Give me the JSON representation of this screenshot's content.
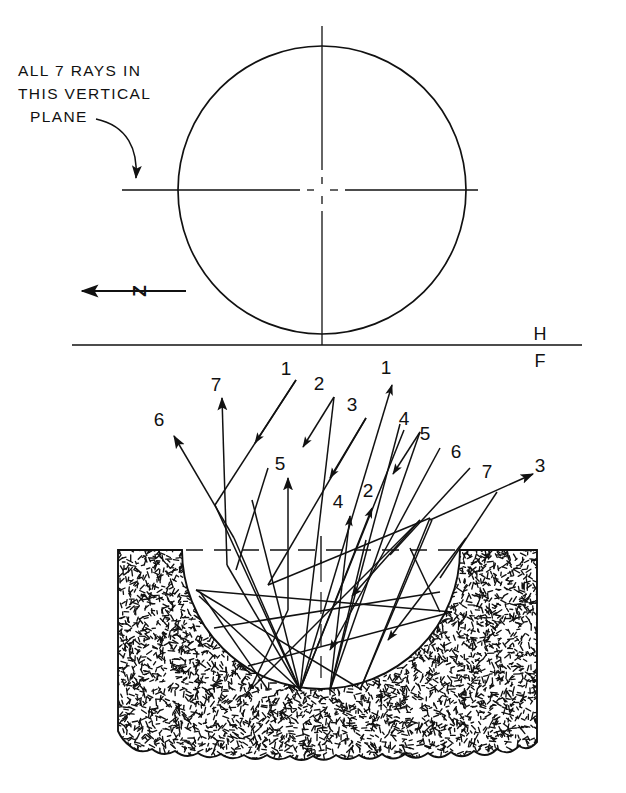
{
  "figure": {
    "type": "orthographic-ray-diagram",
    "note_lines": [
      "ALL 7 RAYS IN",
      "THIS VERTICAL",
      "PLANE"
    ],
    "axis_label": "Z",
    "fold_line": {
      "upper_label": "H",
      "lower_label": "F"
    },
    "ray_count": 7,
    "colors": {
      "ink": "#111111",
      "paper": "#ffffff"
    }
  },
  "top_view": {
    "name": "circle-top-view",
    "center": {
      "x": 322,
      "y": 190
    },
    "radius": 144
  },
  "front_view": {
    "name": "spherical-cavity-front-view",
    "ground_top_y": 550,
    "bowl_center": {
      "x": 321,
      "y": 550
    },
    "bowl_radius": 139
  },
  "ray_labels": [
    {
      "id": "label-7-left",
      "text": "7",
      "x": 216,
      "y": 391
    },
    {
      "id": "label-1-in",
      "text": "1",
      "x": 286,
      "y": 375
    },
    {
      "id": "label-2-in",
      "text": "2",
      "x": 319,
      "y": 390
    },
    {
      "id": "label-3-in",
      "text": "3",
      "x": 352,
      "y": 411
    },
    {
      "id": "label-1-out",
      "text": "1",
      "x": 386,
      "y": 374
    },
    {
      "id": "label-6-left",
      "text": "6",
      "x": 159,
      "y": 426
    },
    {
      "id": "label-4-mid",
      "text": "4",
      "x": 404,
      "y": 425
    },
    {
      "id": "label-5-right",
      "text": "5",
      "x": 425,
      "y": 440
    },
    {
      "id": "label-5-left",
      "text": "5",
      "x": 280,
      "y": 470
    },
    {
      "id": "label-6-right",
      "text": "6",
      "x": 456,
      "y": 458
    },
    {
      "id": "label-7-right",
      "text": "7",
      "x": 487,
      "y": 478
    },
    {
      "id": "label-3-out",
      "text": "3",
      "x": 540,
      "y": 472
    },
    {
      "id": "label-4-low",
      "text": "4",
      "x": 338,
      "y": 508
    },
    {
      "id": "label-2-low",
      "text": "2",
      "x": 368,
      "y": 497
    }
  ],
  "rays": [
    {
      "id": "ray-1-incoming",
      "label": "1",
      "direction": "down-left"
    },
    {
      "id": "ray-2-incoming",
      "label": "2",
      "direction": "down-left"
    },
    {
      "id": "ray-3-incoming",
      "label": "3",
      "direction": "down-left"
    },
    {
      "id": "ray-4-incoming",
      "label": "4",
      "direction": "down-left"
    },
    {
      "id": "ray-5-outgoing",
      "label": "5",
      "direction": "up"
    },
    {
      "id": "ray-6-outgoing",
      "label": "6",
      "direction": "up-left"
    },
    {
      "id": "ray-7-outgoing",
      "label": "7",
      "direction": "up"
    },
    {
      "id": "ray-3-outgoing",
      "label": "3",
      "direction": "up-right"
    }
  ]
}
